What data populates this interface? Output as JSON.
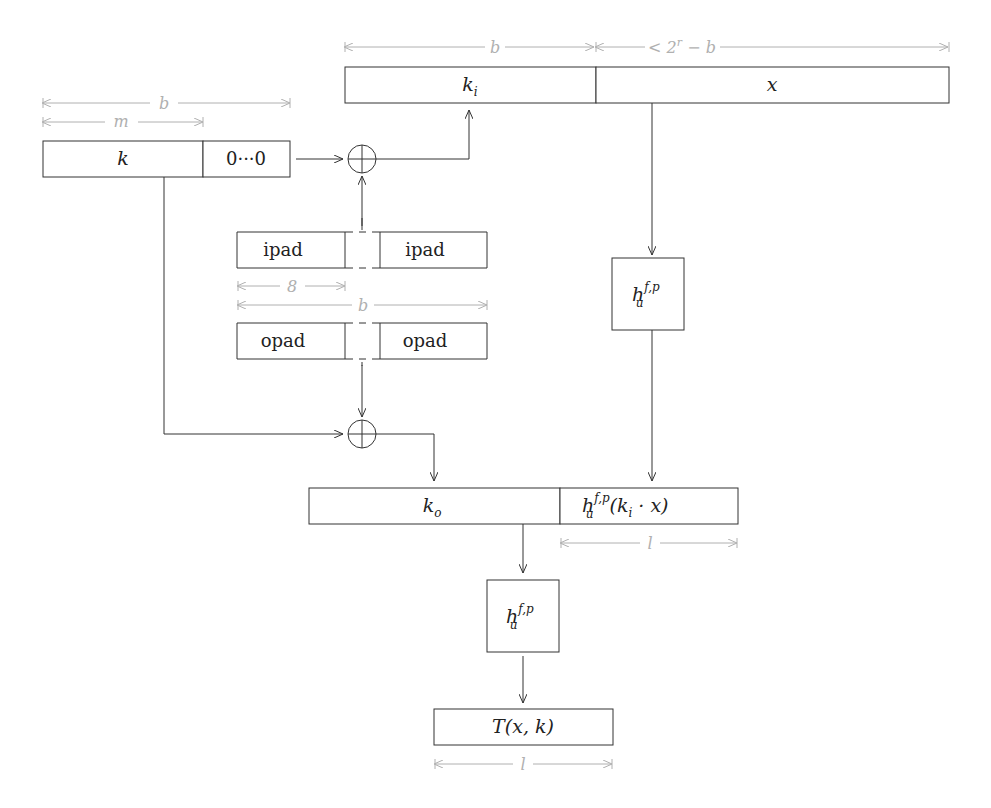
{
  "diagram": {
    "blocks": {
      "ki": {
        "label": "k",
        "sub": "i"
      },
      "x": {
        "label": "x"
      },
      "k": {
        "label": "k"
      },
      "zeros": {
        "label": "0···0"
      },
      "ipad_left": {
        "label": "ipad"
      },
      "ipad_right": {
        "label": "ipad"
      },
      "opad_left": {
        "label": "opad"
      },
      "opad_right": {
        "label": "opad"
      },
      "hash_inner": {
        "label": "h",
        "sup": "f,p",
        "sub": "u"
      },
      "ko": {
        "label": "k",
        "sub": "o"
      },
      "inner_result": {
        "label": "h",
        "sup": "f,p",
        "sub": "u",
        "suffix": "(k",
        "suffix_sub": "i",
        "suffix_end": " · x)"
      },
      "hash_outer": {
        "label": "h",
        "sup": "f,p",
        "sub": "u"
      },
      "output": {
        "label": "T(x, k)"
      }
    },
    "dimensions": {
      "ki_width": "b",
      "x_width": "< 2",
      "x_width_sup": "r",
      "x_width_end": " − b",
      "key_block": "b",
      "key_len": "m",
      "pad_byte": "8",
      "pad_block": "b",
      "inner_len": "l",
      "output_len": "l"
    },
    "operators": {
      "xor_top": "⊕",
      "xor_bottom": "⊕"
    }
  }
}
